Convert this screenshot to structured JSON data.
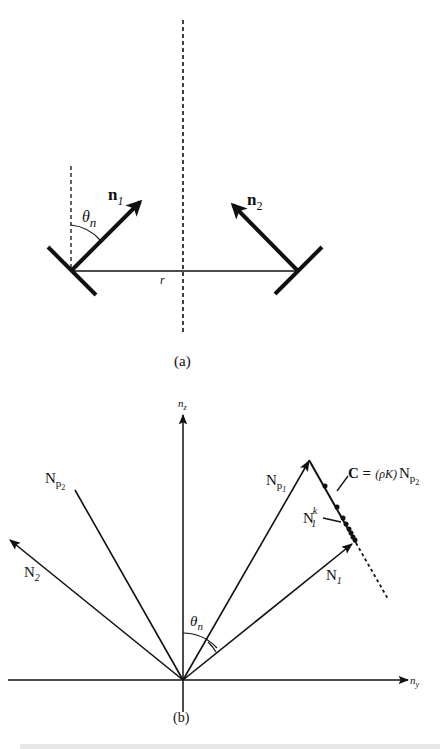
{
  "figure": {
    "panel_a": {
      "caption": "(a)",
      "vector_1": {
        "symbol": "n",
        "subscript": "1"
      },
      "vector_2": {
        "symbol": "n",
        "subscript": "2"
      },
      "angle": {
        "symbol": "θ",
        "subscript": "n"
      },
      "distance": "r"
    },
    "panel_b": {
      "caption": "(b)",
      "axis_vertical": {
        "symbol": "n",
        "subscript": "z"
      },
      "axis_horizontal": {
        "symbol": "n",
        "subscript": "y"
      },
      "angle": {
        "symbol": "θ",
        "subscript": "n"
      },
      "vectors": [
        {
          "symbol": "N",
          "subscript": "p",
          "subsub": "2"
        },
        {
          "symbol": "N",
          "subscript": "2"
        },
        {
          "symbol": "N",
          "subscript": "p",
          "subsub": "1"
        },
        {
          "symbol": "N",
          "subscript": "1"
        }
      ],
      "iterate": {
        "symbol": "N",
        "subscript": "1",
        "superscript": "k"
      },
      "constraint": {
        "lhs": "C =",
        "factor": "(ρK)",
        "rhs_symbol": "N",
        "rhs_subscript": "p",
        "rhs_subsub": "2"
      }
    }
  },
  "colors": {
    "ink": "#111111",
    "background": "#ffffff"
  }
}
